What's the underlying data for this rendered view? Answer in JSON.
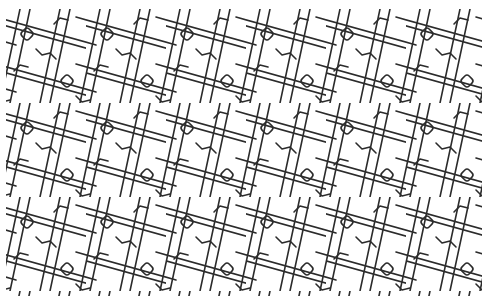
{
  "image": {
    "kind": "decorative lattice pattern",
    "background_color": "#ffffff",
    "stroke_color": "#2b2b2b",
    "stroke_width": 1.6,
    "tile": {
      "width": 40,
      "height": 47,
      "row_offset": 20
    },
    "motifs": [
      "steep-lines",
      "shallow-lines",
      "rounded-diamonds"
    ]
  }
}
